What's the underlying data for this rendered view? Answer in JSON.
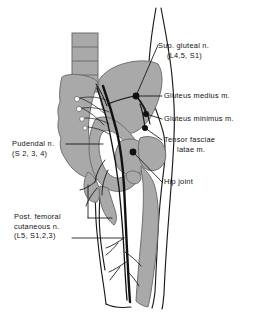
{
  "figure": {
    "background_color": "#ffffff",
    "bone_fill": "#a9a9a9",
    "bone_stroke": "#6f6f6f",
    "outline_color": "#1a1a1a",
    "nerve_color": "#111111",
    "marker_color": "#111111"
  },
  "labels": {
    "sup_gluteal": {
      "line1": "Sup. gluteal n.",
      "line2": "(L4,5, S1)"
    },
    "gluteus_medius": {
      "line1": "Gluteus   medius m."
    },
    "gluteus_minimus": {
      "line1": "Gluteus minimus m."
    },
    "tensor_fasciae": {
      "line1": "Tensor fasciae",
      "line2": "latae m."
    },
    "hip_joint": {
      "line1": "Hip joint"
    },
    "pudendal": {
      "line1": "Pudendal n.",
      "line2": "(S 2, 3, 4)"
    },
    "post_femoral_cutaneous": {
      "line1": "Post. femoral",
      "line2": "cutaneous n.",
      "line3": "(L5, S1,2,3)"
    }
  },
  "structures": {
    "vertebral_column": "lumbar-vertebrae",
    "ilium": "ilium-bone",
    "sacrum": "sacrum-bone",
    "femur": "femur-bone",
    "femoral_head": "femoral-head",
    "greater_trochanter": "greater-trochanter",
    "sciatic_nerve": "sciatic-nerve",
    "body_outline": "body-contour"
  }
}
